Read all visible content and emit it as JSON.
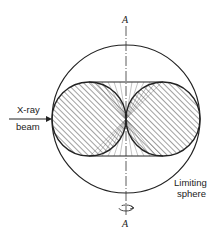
{
  "diagram": {
    "axis_label_top": "A",
    "axis_label_bottom": "A",
    "beam_label_line1": "X-ray",
    "beam_label_line2": "beam",
    "sphere_label_line1": "Limiting",
    "sphere_label_line2": "sphere",
    "icons": {
      "rotation": "rotation-arrow-icon",
      "beam_arrow": "arrow-right-icon"
    },
    "colors": {
      "line": "#222222",
      "background": "#ffffff"
    }
  }
}
